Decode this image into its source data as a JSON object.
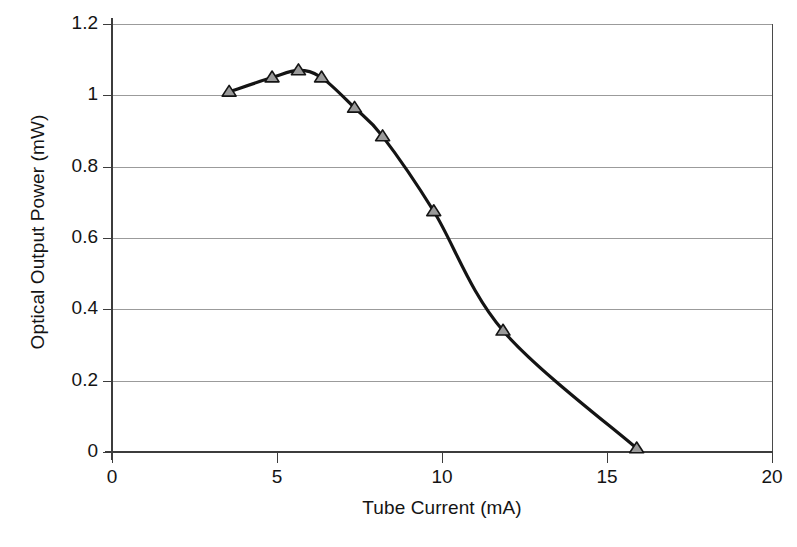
{
  "chart_data": {
    "type": "line",
    "title": "",
    "xlabel": "Tube Current (mA)",
    "ylabel": "Optical Output Power (mW)",
    "xlim": [
      0,
      20
    ],
    "ylim": [
      0,
      1.2
    ],
    "xticks": [
      0,
      5,
      10,
      15,
      20
    ],
    "xticklabels": [
      "0",
      "5",
      "10",
      "15",
      "20"
    ],
    "yticks": [
      0,
      0.2,
      0.4,
      0.6,
      0.8,
      1,
      1.2
    ],
    "yticklabels": [
      "0",
      "0.2",
      "0.4",
      "0.6",
      "0.8",
      "1",
      "1.2"
    ],
    "grid": "horizontal",
    "legend": "none",
    "marker": "triangle-up",
    "line_color": "#141414",
    "marker_fill": "#9a9a9a",
    "marker_edge": "#141414",
    "grid_color": "#9b9b9b",
    "axis_color": "#3c3c3c",
    "series": [
      {
        "name": "Optical output power vs tube current",
        "x": [
          3.55,
          4.85,
          5.65,
          6.35,
          7.35,
          8.2,
          9.75,
          11.85,
          15.9
        ],
        "y": [
          1.01,
          1.05,
          1.07,
          1.05,
          0.965,
          0.885,
          0.675,
          0.34,
          0.01
        ]
      }
    ]
  },
  "axes": {
    "ylabel": "Optical Output Power (mW)",
    "xlabel": "Tube Current (mA)"
  },
  "caption": ""
}
